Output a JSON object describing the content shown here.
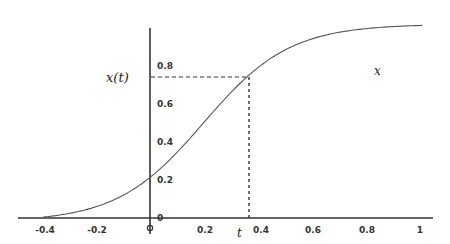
{
  "chart_data": {
    "type": "line",
    "title": "",
    "xlabel": "",
    "ylabel": "",
    "xlim": [
      -0.5,
      1.05
    ],
    "ylim": [
      0,
      1
    ],
    "grid": false,
    "legend": null,
    "x_ticks": [
      "-0.4",
      "-0.2",
      "0",
      "0.2",
      "0.4",
      "0.6",
      "0.8",
      "1"
    ],
    "y_ticks": [
      "0",
      "0.2",
      "0.4",
      "0.6",
      "0.8"
    ],
    "annotations": {
      "y_marker_label": "x(t)",
      "x_marker_label": "t",
      "curve_label": "x",
      "marker_point": {
        "t": 0.37,
        "x": 0.74
      }
    },
    "series": [
      {
        "name": "x",
        "x": [
          -0.4,
          -0.3,
          -0.2,
          -0.1,
          0,
          0.1,
          0.2,
          0.3,
          0.37,
          0.4,
          0.5,
          0.6,
          0.7,
          0.8,
          0.9,
          1.0
        ],
        "values": [
          0.01,
          0.03,
          0.07,
          0.13,
          0.2,
          0.3,
          0.43,
          0.62,
          0.74,
          0.78,
          0.85,
          0.9,
          0.93,
          0.95,
          0.97,
          0.98
        ]
      }
    ]
  },
  "labels": {
    "x_of_t": "x(t)",
    "t": "t",
    "curve": "x",
    "origin_marker": "0"
  }
}
